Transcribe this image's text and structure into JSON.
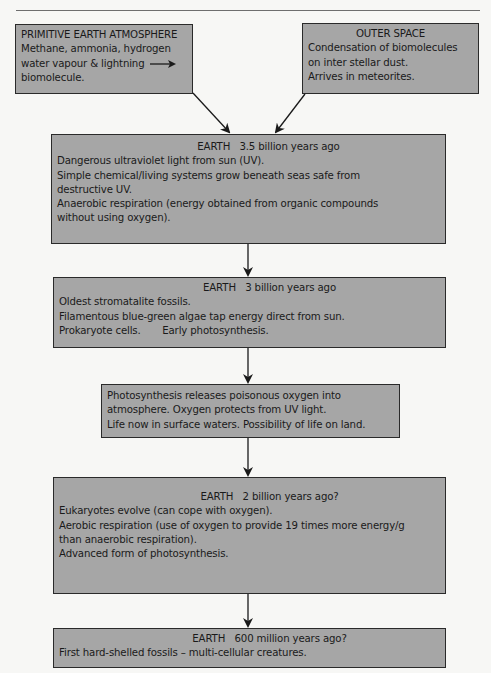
{
  "diagram": {
    "colors": {
      "box_fill": "#a6a6a6",
      "box_border": "#2a2a2a",
      "arrow": "#1a1a1a",
      "background": "#f7f7f5"
    },
    "boxes": {
      "primitive": {
        "heading": "PRIMITIVE EARTH ATMOSPHERE",
        "lines": [
          "Methane, ammonia, hydrogen",
          "water vapour & lightning",
          "biomolecule."
        ],
        "inline_arrow": "right-arrow-icon"
      },
      "outer_space": {
        "heading": "OUTER SPACE",
        "lines": [
          "Condensation of biomolecules",
          "on inter stellar dust.",
          "Arrives in meteorites."
        ]
      },
      "earth_3_5bn": {
        "heading": "EARTH   3.5 billion years ago",
        "lines": [
          "Dangerous ultraviolet light from sun (UV).",
          "Simple chemical/living systems grow beneath seas safe from",
          "destructive UV.",
          "Anaerobic respiration (energy obtained from organic compounds",
          "without using oxygen)."
        ]
      },
      "earth_3bn": {
        "heading": "EARTH   3 billion years ago",
        "lines": [
          "Oldest stromatalite fossils.",
          "Filamentous blue-green algae tap energy direct from sun.",
          "Prokaryote cells.       Early photosynthesis."
        ]
      },
      "photosynthesis": {
        "lines": [
          "Photosynthesis releases poisonous oxygen into",
          "atmosphere. Oxygen protects from UV light.",
          "Life now in surface waters. Possibility of life on land."
        ]
      },
      "earth_2bn": {
        "heading": "EARTH   2 billion years ago?",
        "lines": [
          "Eukaryotes evolve (can cope with oxygen).",
          "Aerobic respiration (use of oxygen to provide 19 times more energy/g",
          "than anaerobic respiration).",
          "Advanced form of photosynthesis."
        ]
      },
      "earth_600m": {
        "heading": "EARTH   600 million years ago?",
        "lines": [
          "First hard-shelled fossils – multi-cellular creatures."
        ]
      }
    },
    "edges": [
      [
        "primitive",
        "earth_3_5bn"
      ],
      [
        "outer_space",
        "earth_3_5bn"
      ],
      [
        "earth_3_5bn",
        "earth_3bn"
      ],
      [
        "earth_3bn",
        "photosynthesis"
      ],
      [
        "photosynthesis",
        "earth_2bn"
      ],
      [
        "earth_2bn",
        "earth_600m"
      ]
    ]
  }
}
